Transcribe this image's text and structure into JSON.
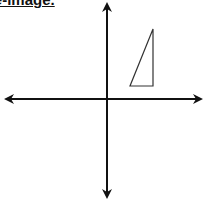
{
  "title": "Pre-image.",
  "diagram": {
    "type": "coordinate-plane",
    "axes": {
      "x_axis": {
        "y": 99,
        "x_start": 4,
        "x_end": 203,
        "arrows": "both"
      },
      "y_axis": {
        "x": 107,
        "y_start": 2,
        "y_end": 199,
        "arrows": "both"
      },
      "color": "#111111"
    },
    "shapes": [
      {
        "name": "pre-image-triangle",
        "type": "right-triangle",
        "quadrant": "I",
        "points": [
          [
            130,
            86
          ],
          [
            153,
            86
          ],
          [
            153,
            29
          ]
        ],
        "stroke": "#333333",
        "fill": "none"
      }
    ]
  }
}
